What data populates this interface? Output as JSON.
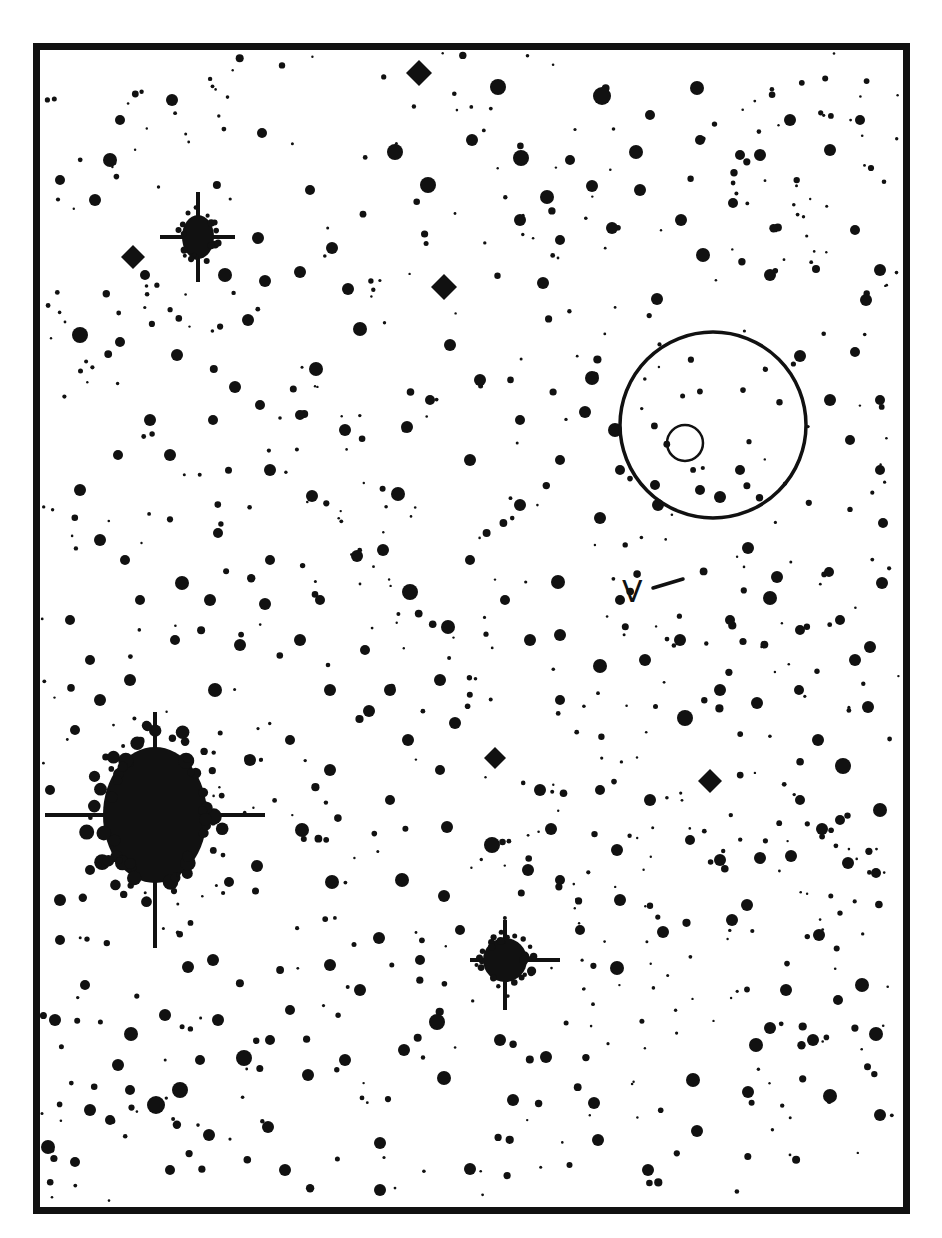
{
  "chart": {
    "title": "",
    "frame": {
      "x": 33,
      "y": 43,
      "width": 877,
      "height": 1171,
      "border": 7,
      "color": "#111111"
    },
    "ink_color": "#111111",
    "background": "#ffffff"
  },
  "annotations": {
    "variable_label": "V",
    "pointer_line": {
      "x1": 653,
      "y1": 588,
      "x2": 683,
      "y2": 579
    },
    "large_circle": {
      "cx": 713,
      "cy": 425,
      "r": 93
    },
    "small_circle": {
      "cx": 685,
      "cy": 443,
      "r": 18
    }
  },
  "bright_stars": [
    {
      "name": "bright-star-left",
      "cx": 155,
      "cy": 815,
      "rx": 52,
      "ry": 68,
      "spike_h": [
        45,
        265
      ],
      "spike_v": [
        712,
        948
      ]
    },
    {
      "name": "bright-star-upper-left",
      "cx": 198,
      "cy": 237,
      "rx": 16,
      "ry": 22,
      "spike_h": [
        160,
        235
      ],
      "spike_v": [
        192,
        282
      ]
    },
    {
      "name": "bright-star-lower-center",
      "cx": 505,
      "cy": 960,
      "rx": 22,
      "ry": 22,
      "spike_h": [
        470,
        560
      ],
      "spike_v": [
        920,
        1010
      ]
    }
  ],
  "diamond_stars": [
    {
      "cx": 419,
      "cy": 73,
      "r": 13
    },
    {
      "cx": 444,
      "cy": 287,
      "r": 13
    },
    {
      "cx": 133,
      "cy": 257,
      "r": 12
    },
    {
      "cx": 710,
      "cy": 781,
      "r": 12
    },
    {
      "cx": 495,
      "cy": 758,
      "r": 11
    }
  ],
  "stars": [
    [
      110,
      160,
      7
    ],
    [
      80,
      335,
      8
    ],
    [
      395,
      152,
      8
    ],
    [
      428,
      185,
      8
    ],
    [
      547,
      197,
      7
    ],
    [
      602,
      96,
      9
    ],
    [
      636,
      152,
      7
    ],
    [
      521,
      158,
      8
    ],
    [
      498,
      87,
      8
    ],
    [
      697,
      88,
      7
    ],
    [
      592,
      186,
      6
    ],
    [
      612,
      228,
      6
    ],
    [
      543,
      283,
      6
    ],
    [
      703,
      255,
      7
    ],
    [
      770,
      275,
      6
    ],
    [
      866,
      300,
      6
    ],
    [
      657,
      299,
      6
    ],
    [
      592,
      378,
      7
    ],
    [
      585,
      412,
      6
    ],
    [
      615,
      430,
      7
    ],
    [
      407,
      427,
      6
    ],
    [
      398,
      494,
      7
    ],
    [
      316,
      369,
      7
    ],
    [
      360,
      329,
      7
    ],
    [
      348,
      289,
      6
    ],
    [
      265,
      281,
      6
    ],
    [
      225,
      275,
      7
    ],
    [
      300,
      272,
      6
    ],
    [
      248,
      320,
      6
    ],
    [
      332,
      248,
      6
    ],
    [
      177,
      355,
      6
    ],
    [
      120,
      342,
      5
    ],
    [
      150,
      420,
      6
    ],
    [
      235,
      387,
      6
    ],
    [
      270,
      470,
      6
    ],
    [
      312,
      496,
      6
    ],
    [
      383,
      550,
      6
    ],
    [
      218,
      533,
      5
    ],
    [
      182,
      583,
      7
    ],
    [
      265,
      604,
      6
    ],
    [
      357,
      556,
      6
    ],
    [
      410,
      592,
      8
    ],
    [
      448,
      627,
      7
    ],
    [
      520,
      505,
      6
    ],
    [
      558,
      582,
      7
    ],
    [
      600,
      518,
      6
    ],
    [
      658,
      505,
      6
    ],
    [
      720,
      497,
      6
    ],
    [
      748,
      548,
      6
    ],
    [
      770,
      598,
      7
    ],
    [
      777,
      577,
      6
    ],
    [
      829,
      572,
      5
    ],
    [
      882,
      583,
      6
    ],
    [
      883,
      523,
      5
    ],
    [
      855,
      352,
      5
    ],
    [
      800,
      356,
      6
    ],
    [
      870,
      647,
      6
    ],
    [
      868,
      707,
      6
    ],
    [
      818,
      740,
      6
    ],
    [
      843,
      766,
      8
    ],
    [
      822,
      829,
      6
    ],
    [
      880,
      810,
      7
    ],
    [
      848,
      863,
      6
    ],
    [
      876,
      873,
      5
    ],
    [
      791,
      856,
      6
    ],
    [
      760,
      858,
      6
    ],
    [
      747,
      905,
      6
    ],
    [
      732,
      920,
      6
    ],
    [
      663,
      932,
      6
    ],
    [
      617,
      850,
      6
    ],
    [
      617,
      968,
      7
    ],
    [
      551,
      829,
      6
    ],
    [
      528,
      870,
      6
    ],
    [
      492,
      845,
      8
    ],
    [
      447,
      827,
      6
    ],
    [
      444,
      896,
      6
    ],
    [
      402,
      880,
      7
    ],
    [
      379,
      938,
      6
    ],
    [
      332,
      882,
      7
    ],
    [
      302,
      830,
      7
    ],
    [
      257,
      866,
      6
    ],
    [
      229,
      882,
      5
    ],
    [
      213,
      960,
      6
    ],
    [
      188,
      967,
      6
    ],
    [
      165,
      1015,
      6
    ],
    [
      131,
      1034,
      7
    ],
    [
      118,
      1065,
      6
    ],
    [
      156,
      1105,
      9
    ],
    [
      180,
      1090,
      8
    ],
    [
      244,
      1058,
      8
    ],
    [
      218,
      1020,
      6
    ],
    [
      209,
      1135,
      6
    ],
    [
      268,
      1127,
      6
    ],
    [
      308,
      1075,
      6
    ],
    [
      345,
      1060,
      6
    ],
    [
      380,
      1143,
      6
    ],
    [
      437,
      1022,
      8
    ],
    [
      444,
      1078,
      7
    ],
    [
      404,
      1050,
      6
    ],
    [
      500,
      1040,
      6
    ],
    [
      546,
      1057,
      6
    ],
    [
      513,
      1100,
      6
    ],
    [
      594,
      1103,
      6
    ],
    [
      598,
      1140,
      6
    ],
    [
      648,
      1170,
      6
    ],
    [
      693,
      1080,
      7
    ],
    [
      697,
      1131,
      6
    ],
    [
      748,
      1092,
      6
    ],
    [
      770,
      1028,
      6
    ],
    [
      813,
      1040,
      6
    ],
    [
      830,
      1096,
      7
    ],
    [
      880,
      1115,
      6
    ],
    [
      876,
      1034,
      7
    ],
    [
      862,
      985,
      7
    ],
    [
      819,
      935,
      6
    ],
    [
      786,
      990,
      6
    ],
    [
      756,
      1045,
      7
    ],
    [
      838,
      1000,
      5
    ],
    [
      48,
      1147,
      7
    ],
    [
      75,
      1162,
      5
    ],
    [
      85,
      985,
      5
    ],
    [
      60,
      900,
      6
    ],
    [
      90,
      870,
      5
    ],
    [
      50,
      790,
      5
    ],
    [
      75,
      730,
      5
    ],
    [
      100,
      700,
      6
    ],
    [
      130,
      680,
      6
    ],
    [
      215,
      690,
      7
    ],
    [
      240,
      645,
      6
    ],
    [
      300,
      640,
      6
    ],
    [
      330,
      690,
      6
    ],
    [
      369,
      711,
      6
    ],
    [
      408,
      740,
      6
    ],
    [
      455,
      723,
      6
    ],
    [
      440,
      680,
      6
    ],
    [
      530,
      640,
      6
    ],
    [
      560,
      635,
      6
    ],
    [
      600,
      666,
      7
    ],
    [
      645,
      660,
      6
    ],
    [
      685,
      718,
      8
    ],
    [
      720,
      690,
      6
    ],
    [
      757,
      703,
      6
    ],
    [
      799,
      690,
      5
    ],
    [
      855,
      660,
      6
    ],
    [
      470,
      1169,
      6
    ],
    [
      285,
      1170,
      6
    ],
    [
      380,
      1190,
      6
    ],
    [
      170,
      1170,
      5
    ],
    [
      110,
      1120,
      5
    ],
    [
      55,
      1020,
      6
    ],
    [
      60,
      940,
      5
    ],
    [
      120,
      120,
      5
    ],
    [
      95,
      200,
      6
    ],
    [
      60,
      180,
      5
    ],
    [
      172,
      100,
      6
    ],
    [
      262,
      133,
      5
    ],
    [
      258,
      238,
      6
    ],
    [
      310,
      190,
      5
    ],
    [
      145,
      275,
      5
    ],
    [
      472,
      140,
      6
    ],
    [
      520,
      220,
      6
    ],
    [
      560,
      240,
      5
    ],
    [
      640,
      190,
      6
    ],
    [
      681,
      220,
      6
    ],
    [
      733,
      203,
      5
    ],
    [
      790,
      120,
      6
    ],
    [
      830,
      150,
      6
    ],
    [
      860,
      120,
      5
    ],
    [
      880,
      270,
      6
    ],
    [
      855,
      230,
      5
    ],
    [
      760,
      155,
      6
    ],
    [
      740,
      155,
      5
    ],
    [
      700,
      140,
      5
    ],
    [
      650,
      115,
      5
    ],
    [
      570,
      160,
      5
    ],
    [
      450,
      345,
      6
    ],
    [
      480,
      380,
      6
    ],
    [
      520,
      420,
      5
    ],
    [
      560,
      460,
      5
    ],
    [
      470,
      460,
      6
    ],
    [
      430,
      400,
      5
    ],
    [
      345,
      430,
      6
    ],
    [
      300,
      415,
      5
    ],
    [
      260,
      405,
      5
    ],
    [
      213,
      420,
      5
    ],
    [
      170,
      455,
      6
    ],
    [
      118,
      455,
      5
    ],
    [
      80,
      490,
      6
    ],
    [
      100,
      540,
      6
    ],
    [
      125,
      560,
      5
    ],
    [
      140,
      600,
      5
    ],
    [
      70,
      620,
      5
    ],
    [
      90,
      660,
      5
    ],
    [
      175,
      640,
      5
    ],
    [
      210,
      600,
      6
    ],
    [
      270,
      560,
      5
    ],
    [
      320,
      600,
      5
    ],
    [
      365,
      650,
      5
    ],
    [
      390,
      690,
      6
    ],
    [
      470,
      560,
      5
    ],
    [
      505,
      600,
      5
    ],
    [
      560,
      700,
      5
    ],
    [
      620,
      600,
      5
    ],
    [
      680,
      640,
      6
    ],
    [
      730,
      620,
      5
    ],
    [
      800,
      630,
      5
    ],
    [
      840,
      620,
      5
    ],
    [
      880,
      470,
      5
    ],
    [
      850,
      440,
      5
    ],
    [
      830,
      400,
      6
    ],
    [
      880,
      400,
      5
    ],
    [
      620,
      470,
      5
    ],
    [
      655,
      485,
      5
    ],
    [
      700,
      490,
      5
    ],
    [
      740,
      470,
      5
    ],
    [
      250,
      760,
      6
    ],
    [
      290,
      740,
      5
    ],
    [
      330,
      770,
      6
    ],
    [
      390,
      800,
      5
    ],
    [
      440,
      770,
      5
    ],
    [
      540,
      790,
      6
    ],
    [
      600,
      790,
      5
    ],
    [
      650,
      800,
      6
    ],
    [
      690,
      840,
      5
    ],
    [
      720,
      860,
      6
    ],
    [
      800,
      800,
      5
    ],
    [
      840,
      820,
      5
    ],
    [
      620,
      900,
      6
    ],
    [
      580,
      930,
      5
    ],
    [
      560,
      880,
      5
    ],
    [
      460,
      930,
      5
    ],
    [
      420,
      960,
      5
    ],
    [
      360,
      990,
      6
    ],
    [
      330,
      965,
      6
    ],
    [
      290,
      1010,
      5
    ],
    [
      270,
      1040,
      5
    ],
    [
      200,
      1060,
      5
    ],
    [
      130,
      1090,
      5
    ],
    [
      90,
      1110,
      6
    ]
  ],
  "background_field": {
    "seed": 7,
    "count": 650,
    "x_range": [
      42,
      902
    ],
    "y_range": [
      52,
      1205
    ],
    "r_min": 1.2,
    "r_max": 4.2
  }
}
